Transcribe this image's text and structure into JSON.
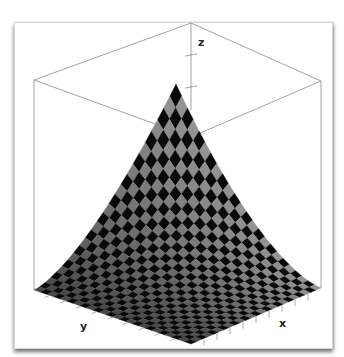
{
  "chart_data": {
    "type": "surface3d",
    "title": "",
    "xlabel": "x",
    "ylabel": "y",
    "zlabel": "z",
    "function": "z = x * y (monotonic increasing surface, rising toward back corner)",
    "grid": "checkerboard mesh 24x24",
    "mesh_colors": [
      "#0a0a0a",
      "#8a8a8a"
    ],
    "bounding_box": true,
    "z_ticks_visible": 2,
    "axis_tick_labels": "none (tick marks only)"
  },
  "labels": {
    "x": "x",
    "y": "y",
    "z": "z"
  }
}
